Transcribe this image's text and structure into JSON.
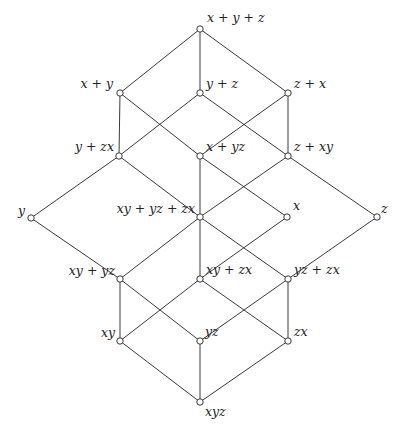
{
  "diagram": {
    "colors": {
      "line": "#3a3a3a",
      "node_fill": "#ffffff",
      "text": "#222222",
      "background": "#ffffff"
    },
    "nodes": [
      {
        "id": "top",
        "label": "x + y + z",
        "x": 200,
        "y": 29,
        "lx": 207,
        "ly": 22,
        "anchor": "start"
      },
      {
        "id": "xpy",
        "label": "x + y",
        "x": 120,
        "y": 93,
        "lx": 113,
        "ly": 88,
        "anchor": "end"
      },
      {
        "id": "ypz",
        "label": "y + z",
        "x": 200,
        "y": 93,
        "lx": 206,
        "ly": 88,
        "anchor": "start"
      },
      {
        "id": "zpx",
        "label": "z + x",
        "x": 288,
        "y": 93,
        "lx": 294,
        "ly": 88,
        "anchor": "start"
      },
      {
        "id": "ypzx",
        "label": "y + zx",
        "x": 119,
        "y": 156,
        "lx": 114,
        "ly": 151,
        "anchor": "end"
      },
      {
        "id": "xpyz",
        "label": "x + yz",
        "x": 200,
        "y": 156,
        "lx": 206,
        "ly": 151,
        "anchor": "start"
      },
      {
        "id": "zpxy",
        "label": "z + xy",
        "x": 288,
        "y": 156,
        "lx": 294,
        "ly": 151,
        "anchor": "start"
      },
      {
        "id": "y",
        "label": "y",
        "x": 31,
        "y": 218,
        "lx": 25,
        "ly": 215,
        "anchor": "end"
      },
      {
        "id": "med",
        "label": "xy + yz + zx",
        "x": 200,
        "y": 217,
        "lx": 195,
        "ly": 213,
        "anchor": "end"
      },
      {
        "id": "x",
        "label": "x",
        "x": 287,
        "y": 217,
        "lx": 293,
        "ly": 210,
        "anchor": "start"
      },
      {
        "id": "z",
        "label": "z",
        "x": 377,
        "y": 217,
        "lx": 381,
        "ly": 213,
        "anchor": "start"
      },
      {
        "id": "xypyz",
        "label": "xy + yz",
        "x": 120,
        "y": 279,
        "lx": 115,
        "ly": 275,
        "anchor": "end"
      },
      {
        "id": "xypzx",
        "label": "xy + zx",
        "x": 200,
        "y": 279,
        "lx": 206,
        "ly": 274,
        "anchor": "start"
      },
      {
        "id": "yzpzx",
        "label": "yz + zx",
        "x": 288,
        "y": 279,
        "lx": 294,
        "ly": 274,
        "anchor": "start"
      },
      {
        "id": "xy",
        "label": "xy",
        "x": 120,
        "y": 341,
        "lx": 115,
        "ly": 337,
        "anchor": "end"
      },
      {
        "id": "yz",
        "label": "yz",
        "x": 200,
        "y": 341,
        "lx": 205,
        "ly": 336,
        "anchor": "start"
      },
      {
        "id": "zx",
        "label": "zx",
        "x": 288,
        "y": 341,
        "lx": 294,
        "ly": 336,
        "anchor": "start"
      },
      {
        "id": "bottom",
        "label": "xyz",
        "x": 200,
        "y": 402,
        "lx": 205,
        "ly": 416,
        "anchor": "start"
      }
    ],
    "edges": [
      [
        "top",
        "xpy"
      ],
      [
        "top",
        "ypz"
      ],
      [
        "top",
        "zpx"
      ],
      [
        "xpy",
        "ypzx"
      ],
      [
        "xpy",
        "xpyz"
      ],
      [
        "ypz",
        "ypzx"
      ],
      [
        "ypz",
        "zpxy"
      ],
      [
        "zpx",
        "zpxy"
      ],
      [
        "zpx",
        "xpyz"
      ],
      [
        "ypzx",
        "y"
      ],
      [
        "ypzx",
        "med"
      ],
      [
        "xpyz",
        "x"
      ],
      [
        "xpyz",
        "med"
      ],
      [
        "zpxy",
        "z"
      ],
      [
        "zpxy",
        "med"
      ],
      [
        "y",
        "xypyz"
      ],
      [
        "x",
        "xypzx"
      ],
      [
        "z",
        "yzpzx"
      ],
      [
        "med",
        "xypyz"
      ],
      [
        "med",
        "xypzx"
      ],
      [
        "med",
        "yzpzx"
      ],
      [
        "xypyz",
        "xy"
      ],
      [
        "xypyz",
        "yz"
      ],
      [
        "xypzx",
        "xy"
      ],
      [
        "xypzx",
        "zx"
      ],
      [
        "yzpzx",
        "yz"
      ],
      [
        "yzpzx",
        "zx"
      ],
      [
        "xy",
        "bottom"
      ],
      [
        "yz",
        "bottom"
      ],
      [
        "zx",
        "bottom"
      ]
    ],
    "node_radius": 3.2
  }
}
